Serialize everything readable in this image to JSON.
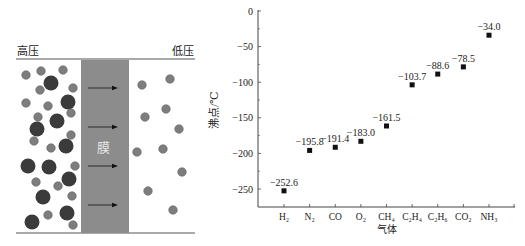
{
  "diagram": {
    "left_label": "高压",
    "right_label": "低压",
    "membrane_label": "膜",
    "colors": {
      "membrane": "#8c8c8c",
      "large_molecule": "#3b3b3b",
      "small_molecule": "#7d7d7d",
      "line": "#555555"
    },
    "arrows_count": 4
  },
  "chart_data": {
    "type": "scatter",
    "title": "",
    "xlabel": "气体",
    "ylabel": "沸点/℃",
    "categories": [
      "H₂",
      "N₂",
      "CO",
      "O₂",
      "CH₄",
      "C₂H₄",
      "C₂H₆",
      "CO₂",
      "NH₃"
    ],
    "values": [
      -252.6,
      -195.8,
      -191.4,
      -183.0,
      -161.5,
      -103.7,
      -88.6,
      -78.5,
      -34.0
    ],
    "data_labels": [
      "−252.6",
      "−195.8",
      "−191.4",
      "−183.0",
      "−161.5",
      "−103.7",
      "−88.6",
      "−78.5",
      "−34.0"
    ],
    "ylim": [
      -275,
      0
    ],
    "yticks": [
      0,
      -50,
      -100,
      -150,
      -200,
      -250
    ],
    "ytick_labels": [
      "0",
      "−50",
      "−100",
      "−150",
      "−200",
      "−250"
    ],
    "grid": false,
    "legend": "none",
    "marker": "square",
    "marker_color": "#111111"
  }
}
